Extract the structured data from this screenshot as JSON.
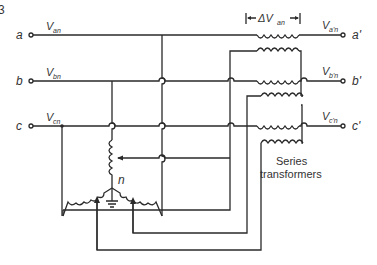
{
  "diagram": {
    "corner_fragment": "3",
    "terminals_in": [
      {
        "id": "a",
        "label": "a",
        "voltage": "V",
        "voltage_sub": "an"
      },
      {
        "id": "b",
        "label": "b",
        "voltage": "V",
        "voltage_sub": "bn"
      },
      {
        "id": "c",
        "label": "c",
        "voltage": "V",
        "voltage_sub": "cn"
      }
    ],
    "terminals_out": [
      {
        "id": "a_prime",
        "label": "a'",
        "voltage": "V",
        "voltage_sub": "a'n"
      },
      {
        "id": "b_prime",
        "label": "b'",
        "voltage": "V",
        "voltage_sub": "b'n"
      },
      {
        "id": "c_prime",
        "label": "c'",
        "voltage": "V",
        "voltage_sub": "c'n"
      }
    ],
    "delta_label": {
      "prefix": "ΔV",
      "sub": "an"
    },
    "neutral_label": "n",
    "series_label_line1": "Series",
    "series_label_line2": "transformers"
  }
}
